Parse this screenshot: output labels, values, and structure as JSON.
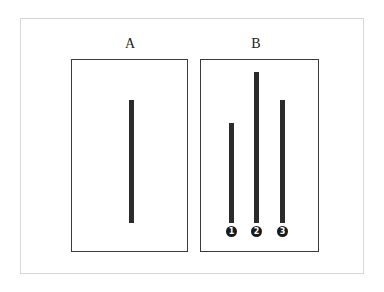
{
  "diagram": {
    "panels": [
      {
        "label": "A",
        "role": "reference"
      },
      {
        "label": "B",
        "role": "comparison"
      }
    ],
    "reference_line": {
      "panel": "A",
      "relative_length": 123
    },
    "comparison_lines": [
      {
        "number": "1",
        "relative_length": 100
      },
      {
        "number": "2",
        "relative_length": 151
      },
      {
        "number": "3",
        "relative_length": 123
      }
    ],
    "colors": {
      "line": "#2b2b2b",
      "border": "#3a3a3a",
      "frame": "#d6d6d6",
      "background": "#ffffff"
    }
  }
}
